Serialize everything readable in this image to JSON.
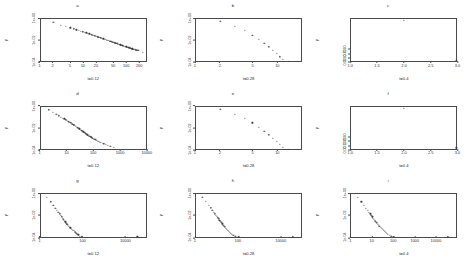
{
  "figure": {
    "type": "multi-panel-scatter-grid",
    "rows": 3,
    "cols": 3,
    "background": "#ffffff",
    "point_color": "#3a3a3a",
    "axis_color": "#4a4a4a"
  },
  "chart_data": [
    {
      "type": "scatter",
      "panel": "a",
      "title": "a",
      "xlabel": "t=0.12",
      "ylabel": "p",
      "xscale": "log",
      "yscale": "log",
      "xlim": [
        1,
        300
      ],
      "ylim": [
        0.0001,
        1
      ],
      "xticks": [
        "1",
        "2",
        "5",
        "10",
        "20",
        "50",
        "100",
        "200"
      ],
      "xtickvals": [
        1,
        2,
        5,
        10,
        20,
        50,
        100,
        200
      ],
      "yticks": [
        "1e-04",
        "1e-02",
        "1e+00"
      ],
      "ytickvals": [
        0.0001,
        0.01,
        1
      ],
      "grid": false,
      "legend": "none",
      "n_points": 72,
      "x": [
        2,
        3,
        4,
        5,
        6,
        7,
        8,
        9,
        10,
        11,
        12,
        13,
        14,
        15,
        16,
        17,
        18,
        19,
        20,
        21,
        22,
        23,
        24,
        25,
        26,
        28,
        30,
        32,
        34,
        36,
        38,
        40,
        42,
        44,
        46,
        48,
        50,
        52,
        55,
        58,
        61,
        64,
        67,
        70,
        73,
        76,
        80,
        84,
        88,
        92,
        96,
        100,
        104,
        108,
        112,
        116,
        120,
        125,
        130,
        135,
        140,
        145,
        150,
        155,
        160,
        166,
        172,
        178,
        184,
        190,
        200,
        260
      ],
      "y": [
        0.52,
        0.27,
        0.2,
        0.155,
        0.12,
        0.1,
        0.085,
        0.073,
        0.063,
        0.056,
        0.05,
        0.045,
        0.041,
        0.037,
        0.034,
        0.031,
        0.029,
        0.027,
        0.025,
        0.0235,
        0.022,
        0.0205,
        0.0193,
        0.0182,
        0.0172,
        0.0155,
        0.014,
        0.0128,
        0.0117,
        0.0108,
        0.01,
        0.0093,
        0.0087,
        0.0081,
        0.0076,
        0.0072,
        0.0068,
        0.0064,
        0.0059,
        0.0055,
        0.0051,
        0.0048,
        0.0045,
        0.0042,
        0.004,
        0.0038,
        0.0035,
        0.0033,
        0.0031,
        0.0029,
        0.0027,
        0.0026,
        0.0024,
        0.0023,
        0.0022,
        0.0021,
        0.002,
        0.0019,
        0.0018,
        0.0017,
        0.0016,
        0.00155,
        0.0015,
        0.00145,
        0.0014,
        0.00133,
        0.00127,
        0.00122,
        0.00117,
        0.00113,
        0.00105,
        0.00075
      ]
    },
    {
      "type": "scatter",
      "panel": "b",
      "title": "b",
      "xlabel": "t=0.28",
      "ylabel": "p",
      "xscale": "log",
      "yscale": "log",
      "xlim": [
        1,
        20
      ],
      "ylim": [
        0.0001,
        1
      ],
      "xticks": [
        "1",
        "2",
        "5",
        "10"
      ],
      "xtickvals": [
        1,
        2,
        5,
        10
      ],
      "yticks": [
        "1e-04",
        "1e-02",
        "1e+00"
      ],
      "ytickvals": [
        0.0001,
        0.01,
        1
      ],
      "grid": false,
      "legend": "none",
      "n_points": 12,
      "x": [
        2,
        3,
        4,
        5,
        6,
        7,
        8,
        9,
        10,
        11,
        12,
        14
      ],
      "y": [
        0.62,
        0.22,
        0.085,
        0.032,
        0.013,
        0.0055,
        0.0024,
        0.0011,
        0.00055,
        0.00028,
        0.00016,
        0.0001
      ]
    },
    {
      "type": "scatter",
      "panel": "c",
      "title": "c",
      "xlabel": "t=0.4",
      "ylabel": "p",
      "xscale": "linear",
      "yscale": "linear",
      "xlim": [
        1.0,
        3.0
      ],
      "ylim": [
        0.0,
        1.0
      ],
      "xticks": [
        "1.0",
        "1.5",
        "2.0",
        "2.5",
        "3.0"
      ],
      "xtickvals": [
        1.0,
        1.5,
        2.0,
        2.5,
        3.0
      ],
      "yticks": [
        "0.00",
        "0.10",
        "0.20",
        "0.30"
      ],
      "ytickvals": [
        0.0,
        0.1,
        0.2,
        0.3
      ],
      "grid": false,
      "legend": "none",
      "n_points": 2,
      "x": [
        2.0,
        3.0
      ],
      "y": [
        0.97,
        0.03
      ]
    },
    {
      "type": "scatter",
      "panel": "d",
      "title": "d",
      "xlabel": "t=0.12",
      "ylabel": "p",
      "xscale": "log",
      "yscale": "log",
      "xlim": [
        1,
        10000
      ],
      "ylim": [
        0.0001,
        1
      ],
      "xticks": [
        "1",
        "10",
        "100",
        "1000",
        "10000"
      ],
      "xtickvals": [
        1,
        10,
        100,
        1000,
        10000
      ],
      "yticks": [
        "1e-04",
        "1e-02",
        "1e+00"
      ],
      "ytickvals": [
        0.0001,
        0.01,
        1
      ],
      "grid": false,
      "legend": "none",
      "n_points": 60,
      "x": [
        2,
        3,
        4,
        5,
        6,
        7,
        8,
        9,
        10,
        11,
        12,
        13,
        14,
        15,
        16,
        17,
        18,
        19,
        20,
        22,
        24,
        26,
        28,
        30,
        32,
        34,
        36,
        38,
        40,
        42,
        45,
        48,
        51,
        54,
        57,
        60,
        64,
        68,
        72,
        76,
        80,
        85,
        90,
        95,
        100,
        110,
        120,
        130,
        140,
        150,
        165,
        180,
        200,
        230,
        260,
        300,
        360,
        450,
        600,
        9000
      ],
      "y": [
        0.52,
        0.3,
        0.2,
        0.145,
        0.11,
        0.088,
        0.072,
        0.06,
        0.051,
        0.044,
        0.039,
        0.034,
        0.03,
        0.027,
        0.024,
        0.022,
        0.02,
        0.018,
        0.0165,
        0.014,
        0.012,
        0.0105,
        0.0092,
        0.0082,
        0.0073,
        0.0065,
        0.0059,
        0.0053,
        0.0048,
        0.0044,
        0.0039,
        0.0035,
        0.0031,
        0.0028,
        0.0026,
        0.0023,
        0.0021,
        0.0019,
        0.0017,
        0.00155,
        0.00142,
        0.0013,
        0.0012,
        0.0011,
        0.001,
        0.00088,
        0.00078,
        0.0007,
        0.00063,
        0.00058,
        0.00051,
        0.00046,
        0.00041,
        0.00035,
        0.00031,
        0.00027,
        0.00023,
        0.00019,
        0.00015,
        0.0001
      ]
    },
    {
      "type": "scatter",
      "panel": "e",
      "title": "e",
      "xlabel": "t=0.28",
      "ylabel": "p",
      "xscale": "log",
      "yscale": "log",
      "xlim": [
        1,
        20
      ],
      "ylim": [
        0.0001,
        1
      ],
      "xticks": [
        "1",
        "2",
        "5",
        "10"
      ],
      "xtickvals": [
        1,
        2,
        5,
        10
      ],
      "yticks": [
        "1e-04",
        "1e-02",
        "1e+00"
      ],
      "ytickvals": [
        0.0001,
        0.01,
        1
      ],
      "grid": false,
      "legend": "none",
      "n_points": 12,
      "x": [
        2,
        3,
        4,
        5,
        6,
        7,
        8,
        9,
        10,
        11,
        12,
        14
      ],
      "y": [
        0.6,
        0.21,
        0.082,
        0.031,
        0.0125,
        0.0052,
        0.0023,
        0.00105,
        0.00052,
        0.00027,
        0.00015,
        0.0001
      ]
    },
    {
      "type": "scatter",
      "panel": "f",
      "title": "f",
      "xlabel": "t=0.4",
      "ylabel": "p",
      "xscale": "linear",
      "yscale": "linear",
      "xlim": [
        1.0,
        3.0
      ],
      "ylim": [
        0.0,
        1.0
      ],
      "xticks": [
        "1.0",
        "1.5",
        "2.0",
        "2.5",
        "3.0"
      ],
      "xtickvals": [
        1.0,
        1.5,
        2.0,
        2.5,
        3.0
      ],
      "yticks": [
        "0.00",
        "0.10",
        "0.20",
        "0.30"
      ],
      "ytickvals": [
        0.0,
        0.1,
        0.2,
        0.3
      ],
      "grid": false,
      "legend": "none",
      "n_points": 2,
      "x": [
        2.0,
        3.0
      ],
      "y": [
        0.97,
        0.03
      ]
    },
    {
      "type": "scatter",
      "panel": "g",
      "title": "g",
      "xlabel": "t=0.12",
      "ylabel": "p",
      "xscale": "log",
      "yscale": "log",
      "xlim": [
        1,
        100000
      ],
      "ylim": [
        0.0001,
        1
      ],
      "xticks": [
        "1",
        "100",
        "10000"
      ],
      "xtickvals": [
        1,
        100,
        10000
      ],
      "yticks": [
        "1e-04",
        "1e-02",
        "1e+00"
      ],
      "ytickvals": [
        0.0001,
        0.01,
        1
      ],
      "grid": false,
      "legend": "none",
      "n_points": 34,
      "x": [
        2,
        3,
        4,
        5,
        6,
        7,
        8,
        9,
        10,
        11,
        12,
        13,
        14,
        15,
        16,
        17,
        18,
        19,
        20,
        22,
        24,
        26,
        28,
        31,
        34,
        37,
        41,
        45,
        50,
        56,
        63,
        72,
        90,
        40000
      ],
      "y": [
        0.56,
        0.2,
        0.095,
        0.052,
        0.032,
        0.021,
        0.0145,
        0.0105,
        0.0078,
        0.006,
        0.0047,
        0.0038,
        0.0031,
        0.0026,
        0.0022,
        0.0019,
        0.0016,
        0.0014,
        0.00125,
        0.001,
        0.00085,
        0.00072,
        0.00062,
        0.00052,
        0.00044,
        0.00038,
        0.00032,
        0.00027,
        0.00022,
        0.00018,
        0.00015,
        0.00012,
        0.0001,
        0.0001
      ]
    },
    {
      "type": "scatter",
      "panel": "h",
      "title": "h",
      "xlabel": "t=0.28",
      "ylabel": "p",
      "xscale": "log",
      "yscale": "log",
      "xlim": [
        1,
        100000
      ],
      "ylim": [
        0.0001,
        1
      ],
      "xticks": [
        "1",
        "100",
        "10000"
      ],
      "xtickvals": [
        1,
        100,
        10000
      ],
      "yticks": [
        "1e-04",
        "1e-02",
        "1e+00"
      ],
      "ytickvals": [
        0.0001,
        0.01,
        1
      ],
      "grid": false,
      "legend": "none",
      "n_points": 30,
      "x": [
        2,
        3,
        4,
        5,
        6,
        7,
        8,
        9,
        10,
        11,
        12,
        13,
        14,
        15,
        16,
        18,
        20,
        22,
        24,
        27,
        30,
        33,
        37,
        41,
        46,
        52,
        60,
        75,
        110,
        40000
      ],
      "y": [
        0.58,
        0.21,
        0.098,
        0.054,
        0.033,
        0.022,
        0.015,
        0.0108,
        0.008,
        0.0062,
        0.0049,
        0.0039,
        0.0032,
        0.0027,
        0.0023,
        0.0017,
        0.0013,
        0.00105,
        0.00086,
        0.00066,
        0.00053,
        0.00043,
        0.00035,
        0.00028,
        0.00023,
        0.00018,
        0.00014,
        0.00011,
        0.0001,
        0.0001
      ]
    },
    {
      "type": "scatter",
      "panel": "i",
      "title": "i",
      "xlabel": "t=0.4",
      "ylabel": "p",
      "xscale": "log",
      "yscale": "log",
      "xlim": [
        1,
        100000
      ],
      "ylim": [
        0.0001,
        1
      ],
      "xticks": [
        "1",
        "10",
        "100",
        "1000",
        "10000"
      ],
      "xtickvals": [
        1,
        10,
        100,
        1000,
        10000
      ],
      "yticks": [
        "1e-04",
        "1e-02",
        "1e+00"
      ],
      "ytickvals": [
        0.0001,
        0.01,
        1
      ],
      "grid": false,
      "legend": "none",
      "n_points": 30,
      "x": [
        2,
        3,
        4,
        5,
        6,
        7,
        8,
        9,
        10,
        11,
        12,
        13,
        14,
        15,
        16,
        18,
        20,
        22,
        25,
        28,
        31,
        35,
        39,
        44,
        50,
        57,
        66,
        80,
        110,
        40000
      ],
      "y": [
        0.57,
        0.2,
        0.093,
        0.051,
        0.031,
        0.021,
        0.0145,
        0.0104,
        0.0077,
        0.0059,
        0.0046,
        0.0037,
        0.003,
        0.0025,
        0.0021,
        0.0016,
        0.0012,
        0.00097,
        0.00074,
        0.0006,
        0.00049,
        0.0004,
        0.00033,
        0.00027,
        0.00022,
        0.00017,
        0.00014,
        0.00011,
        0.0001,
        0.0001
      ]
    }
  ]
}
